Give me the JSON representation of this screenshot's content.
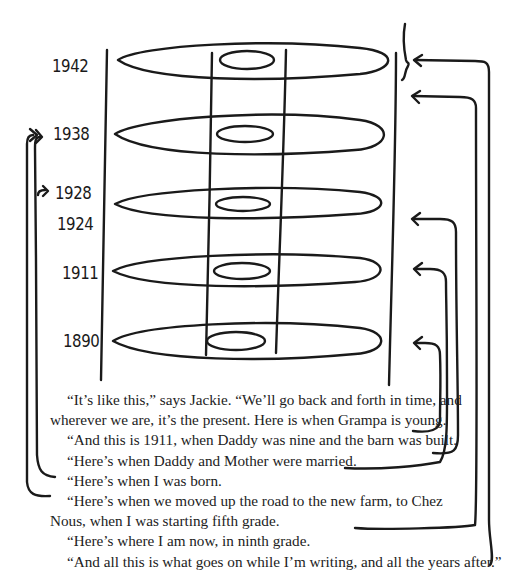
{
  "diagram": {
    "years": [
      {
        "label": "1942",
        "y": 57
      },
      {
        "label": "1938",
        "y": 126
      },
      {
        "label": "1928",
        "y": 186
      },
      {
        "label": "1924",
        "y": 214
      },
      {
        "label": "1911",
        "y": 264
      },
      {
        "label": "1890",
        "y": 332
      }
    ],
    "layers": [
      "top (writing and after)",
      "1938",
      "1924/1928",
      "1911",
      "1890"
    ]
  },
  "prose": {
    "p1_line1": "“It’s like this,” says Jackie. “We’ll go back and forth in time, and",
    "p1_line2": "wherever we are, it’s the present. Here is when Grampa is young.",
    "p2": "“And this is 1911, when Daddy was nine and the barn was built.",
    "p3": "“Here’s when Daddy and Mother were married.",
    "p4": "“Here’s when I was born.",
    "p5_line1": "“Here’s when we moved up the road to the new farm, to Chez",
    "p5_line2": "Nous, when I was starting fifth grade.",
    "p6": "“Here’s where I am now, in ninth grade.",
    "p7": "“And all this is what goes on while I’m writing, and all the years after.”"
  }
}
